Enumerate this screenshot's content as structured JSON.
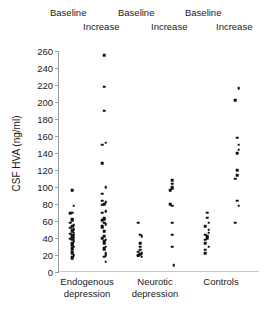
{
  "chart_data": {
    "type": "scatter",
    "title": "",
    "xlabel": "",
    "ylabel": "CSF HVA (ng/ml)",
    "ylim": [
      0,
      260
    ],
    "yticks": [
      0,
      20,
      40,
      60,
      80,
      100,
      120,
      140,
      160,
      180,
      200,
      220,
      240,
      260
    ],
    "grid": false,
    "legend_position": "top",
    "point_color": "#111111",
    "axis_color": "#9a9a9a",
    "column_headers": [
      "Baseline",
      "Increase",
      "Baseline",
      "Increase",
      "Baseline",
      "Increase"
    ],
    "groups": [
      {
        "name": "Endogenous depression",
        "label_line1": "Endogenous",
        "label_line2": "depression",
        "columns": [
          {
            "name": "Baseline",
            "values": [
              96,
              78,
              70,
              69,
              62,
              61,
              58,
              55,
              54,
              52,
              51,
              50,
              49,
              48,
              46,
              45,
              44,
              43,
              42,
              41,
              40,
              39,
              38,
              36,
              34,
              33,
              31,
              30,
              28,
              26,
              24,
              22,
              20,
              18,
              16
            ]
          },
          {
            "name": "Increase",
            "values": [
              255,
              218,
              190,
              152,
              150,
              128,
              100,
              92,
              84,
              82,
              80,
              79,
              72,
              71,
              70,
              64,
              62,
              61,
              58,
              56,
              54,
              52,
              48,
              42,
              40,
              38,
              36,
              34,
              30,
              28,
              26,
              22,
              20,
              18,
              12
            ]
          }
        ]
      },
      {
        "name": "Neurotic depression",
        "label_line1": "Neurotic",
        "label_line2": "depression",
        "columns": [
          {
            "name": "Baseline",
            "values": [
              58,
              44,
              42,
              34,
              30,
              26,
              24,
              22,
              21,
              20,
              19,
              18
            ]
          },
          {
            "name": "Increase",
            "values": [
              108,
              104,
              100,
              98,
              96,
              80,
              78,
              58,
              44,
              30,
              8
            ]
          }
        ]
      },
      {
        "name": "Controls",
        "label_line1": "Controls",
        "label_line2": "",
        "columns": [
          {
            "name": "Baseline",
            "values": [
              70,
              64,
              58,
              54,
              50,
              46,
              44,
              42,
              40,
              38,
              34,
              30,
              26,
              22
            ]
          },
          {
            "name": "Increase",
            "values": [
              216,
              202,
              158,
              150,
              144,
              140,
              120,
              114,
              110,
              84,
              78,
              58
            ]
          }
        ]
      }
    ]
  },
  "axis": {
    "y_title": "CSF HVA (ng/ml)"
  }
}
